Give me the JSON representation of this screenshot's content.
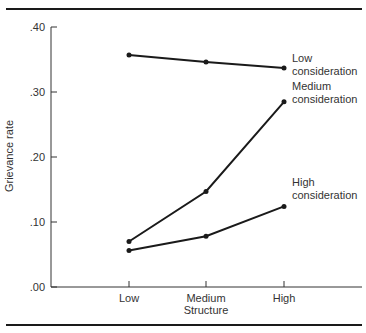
{
  "chart_data": {
    "type": "line",
    "title": "",
    "xlabel": "Structure",
    "ylabel": "Grievance rate",
    "categories": [
      "Low",
      "Medium",
      "High"
    ],
    "ylim": [
      0.0,
      0.4
    ],
    "yticks": [
      ".00",
      ".10",
      ".20",
      ".30",
      ".40"
    ],
    "ytick_values": [
      0.0,
      0.1,
      0.2,
      0.3,
      0.4
    ],
    "grid": false,
    "legend_position": "inline-right",
    "series": [
      {
        "name": "Low consideration",
        "label_lines": [
          "Low",
          "consideration"
        ],
        "values": [
          0.357,
          0.346,
          0.337
        ]
      },
      {
        "name": "Medium consideration",
        "label_lines": [
          "Medium",
          "consideration"
        ],
        "values": [
          0.07,
          0.147,
          0.285
        ]
      },
      {
        "name": "High consideration",
        "label_lines": [
          "High",
          "consideration"
        ],
        "values": [
          0.056,
          0.078,
          0.124
        ]
      }
    ]
  },
  "layout": {
    "line_color": "#1a1a1a"
  }
}
